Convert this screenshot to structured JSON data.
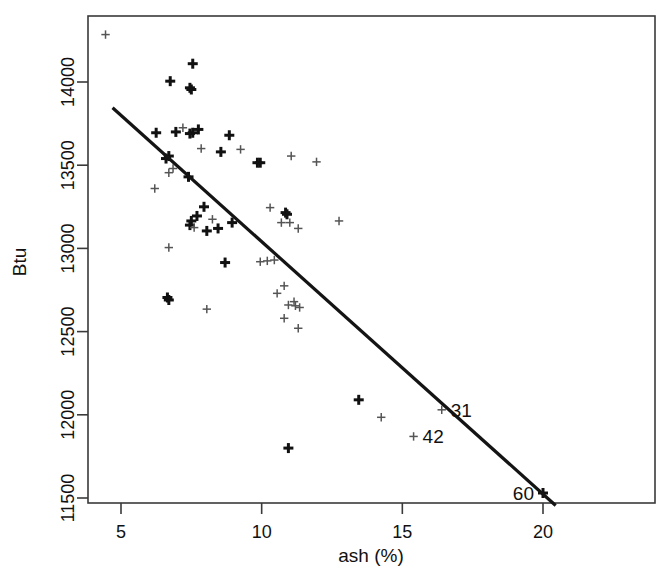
{
  "chart_data": {
    "type": "scatter",
    "title": "",
    "xlabel": "ash (%)",
    "ylabel": "Btu",
    "xlim": [
      3.86,
      20.0
    ],
    "ylim": [
      11420,
      14115
    ],
    "xticks": [
      5,
      10,
      15,
      20
    ],
    "xtick_labels": [
      "5",
      "10",
      "15",
      "20"
    ],
    "yticks": [
      11500,
      12000,
      12500,
      13000,
      13500,
      14000
    ],
    "ytick_labels": [
      "11500",
      "12000",
      "12500",
      "13000",
      "13500",
      "14000"
    ],
    "grid": false,
    "legend": null,
    "marker": "plus",
    "points": [
      {
        "x": 4.45,
        "y": 14285,
        "weight": "light"
      },
      {
        "x": 6.75,
        "y": 14005,
        "weight": "bold"
      },
      {
        "x": 7.55,
        "y": 14110,
        "weight": "bold"
      },
      {
        "x": 7.45,
        "y": 13965,
        "weight": "bold"
      },
      {
        "x": 7.5,
        "y": 13955,
        "weight": "bold"
      },
      {
        "x": 6.25,
        "y": 13695,
        "weight": "bold"
      },
      {
        "x": 6.95,
        "y": 13700,
        "weight": "bold"
      },
      {
        "x": 7.2,
        "y": 13725,
        "weight": "light"
      },
      {
        "x": 7.45,
        "y": 13690,
        "weight": "bold"
      },
      {
        "x": 7.55,
        "y": 13695,
        "weight": "bold"
      },
      {
        "x": 7.75,
        "y": 13715,
        "weight": "bold"
      },
      {
        "x": 8.85,
        "y": 13680,
        "weight": "bold"
      },
      {
        "x": 7.85,
        "y": 13600,
        "weight": "light"
      },
      {
        "x": 6.6,
        "y": 13540,
        "weight": "bold"
      },
      {
        "x": 6.7,
        "y": 13555,
        "weight": "bold"
      },
      {
        "x": 8.55,
        "y": 13580,
        "weight": "bold"
      },
      {
        "x": 9.25,
        "y": 13595,
        "weight": "light"
      },
      {
        "x": 11.05,
        "y": 13555,
        "weight": "light"
      },
      {
        "x": 9.85,
        "y": 13515,
        "weight": "bold"
      },
      {
        "x": 9.95,
        "y": 13515,
        "weight": "bold"
      },
      {
        "x": 6.7,
        "y": 13455,
        "weight": "light"
      },
      {
        "x": 6.85,
        "y": 13480,
        "weight": "light"
      },
      {
        "x": 7.4,
        "y": 13430,
        "weight": "bold"
      },
      {
        "x": 11.95,
        "y": 13520,
        "weight": "light"
      },
      {
        "x": 6.2,
        "y": 13360,
        "weight": "light"
      },
      {
        "x": 7.95,
        "y": 13250,
        "weight": "bold"
      },
      {
        "x": 7.7,
        "y": 13195,
        "weight": "bold"
      },
      {
        "x": 7.5,
        "y": 13165,
        "weight": "bold"
      },
      {
        "x": 7.45,
        "y": 13140,
        "weight": "bold"
      },
      {
        "x": 7.6,
        "y": 13125,
        "weight": "light"
      },
      {
        "x": 8.25,
        "y": 13175,
        "weight": "light"
      },
      {
        "x": 8.95,
        "y": 13155,
        "weight": "bold"
      },
      {
        "x": 10.3,
        "y": 13245,
        "weight": "light"
      },
      {
        "x": 10.85,
        "y": 13215,
        "weight": "bold"
      },
      {
        "x": 10.9,
        "y": 13205,
        "weight": "bold"
      },
      {
        "x": 10.7,
        "y": 13155,
        "weight": "light"
      },
      {
        "x": 11.0,
        "y": 13155,
        "weight": "light"
      },
      {
        "x": 11.3,
        "y": 13120,
        "weight": "light"
      },
      {
        "x": 8.05,
        "y": 13105,
        "weight": "bold"
      },
      {
        "x": 8.45,
        "y": 13120,
        "weight": "bold"
      },
      {
        "x": 12.75,
        "y": 13165,
        "weight": "light"
      },
      {
        "x": 6.7,
        "y": 13005,
        "weight": "light"
      },
      {
        "x": 8.7,
        "y": 12915,
        "weight": "bold"
      },
      {
        "x": 9.95,
        "y": 12920,
        "weight": "light"
      },
      {
        "x": 10.2,
        "y": 12925,
        "weight": "light"
      },
      {
        "x": 10.45,
        "y": 12930,
        "weight": "light"
      },
      {
        "x": 10.8,
        "y": 12775,
        "weight": "light"
      },
      {
        "x": 10.55,
        "y": 12730,
        "weight": "light"
      },
      {
        "x": 6.65,
        "y": 12705,
        "weight": "bold"
      },
      {
        "x": 6.7,
        "y": 12690,
        "weight": "bold"
      },
      {
        "x": 8.05,
        "y": 12635,
        "weight": "light"
      },
      {
        "x": 10.95,
        "y": 12660,
        "weight": "light"
      },
      {
        "x": 11.15,
        "y": 12680,
        "weight": "light"
      },
      {
        "x": 11.2,
        "y": 12655,
        "weight": "light"
      },
      {
        "x": 11.35,
        "y": 12645,
        "weight": "light"
      },
      {
        "x": 10.8,
        "y": 12580,
        "weight": "light"
      },
      {
        "x": 11.3,
        "y": 12520,
        "weight": "light"
      },
      {
        "x": 13.45,
        "y": 12090,
        "weight": "bold"
      },
      {
        "x": 14.25,
        "y": 11985,
        "weight": "light"
      },
      {
        "x": 10.95,
        "y": 11800,
        "weight": "bold"
      },
      {
        "x": 16.4,
        "y": 12030,
        "weight": "light",
        "label": "31"
      },
      {
        "x": 15.4,
        "y": 11870,
        "weight": "light",
        "label": "42"
      },
      {
        "x": 20.0,
        "y": 11530,
        "weight": "bold",
        "label": "60"
      }
    ],
    "regression_line": {
      "x_start": 4.7,
      "y_start": 13845,
      "x_end": 20.45,
      "y_end": 11455
    }
  },
  "annotations": {
    "label_31": "31",
    "label_42": "42",
    "label_60": "60"
  }
}
